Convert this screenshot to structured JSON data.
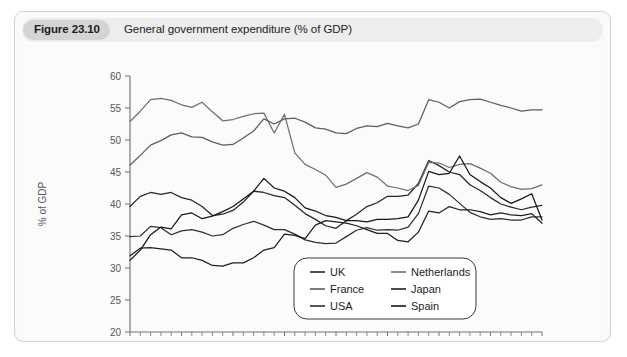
{
  "figure": {
    "number": "Figure 23.10",
    "caption": "General government expenditure (% of GDP)"
  },
  "chart_data": {
    "type": "line",
    "title": "General government expenditure (% of GDP)",
    "xlabel": "",
    "ylabel": "% of GDP",
    "xlim": [
      1980,
      2020
    ],
    "ylim": [
      20,
      60
    ],
    "yticks": [
      20,
      25,
      30,
      35,
      40,
      45,
      50,
      55,
      60
    ],
    "xticks": [
      1980,
      1985,
      1990,
      1995,
      2000,
      2005,
      2010,
      2015,
      2020
    ],
    "xtick_labels": [
      "1980",
      "1985",
      "1990",
      "1995",
      "2000",
      "2005",
      "2010",
      "2015",
      "2020"
    ],
    "ytick_labels": [
      "20",
      "25",
      "30",
      "35",
      "40",
      "45",
      "50",
      "55",
      "60"
    ],
    "minor_xticks": true,
    "grid": false,
    "legend_position": "bottom-right",
    "x": [
      1980,
      1981,
      1982,
      1983,
      1984,
      1985,
      1986,
      1987,
      1988,
      1989,
      1990,
      1991,
      1992,
      1993,
      1994,
      1995,
      1996,
      1997,
      1998,
      1999,
      2000,
      2001,
      2002,
      2003,
      2004,
      2005,
      2006,
      2007,
      2008,
      2009,
      2010,
      2011,
      2012,
      2013,
      2014,
      2015,
      2016,
      2017,
      2018,
      2019,
      2020
    ],
    "series": [
      {
        "name": "UK",
        "color": "#262626",
        "values": [
          39.6,
          41.2,
          41.8,
          41.5,
          41.8,
          41.0,
          40.6,
          39.6,
          38.2,
          38.4,
          39.0,
          40.3,
          42.0,
          41.8,
          41.3,
          41.0,
          39.8,
          38.5,
          37.6,
          36.6,
          36.2,
          37.4,
          38.4,
          39.6,
          40.2,
          41.2,
          41.2,
          41.4,
          43.2,
          46.8,
          46.0,
          45.0,
          44.6,
          43.0,
          42.1,
          41.0,
          40.0,
          39.5,
          39.1,
          39.5,
          39.8
        ]
      },
      {
        "name": "France",
        "color": "#5d5d5d",
        "values": [
          46.1,
          47.6,
          49.2,
          49.9,
          50.8,
          51.1,
          50.5,
          50.4,
          49.7,
          49.2,
          49.3,
          50.3,
          51.4,
          53.3,
          52.5,
          53.3,
          53.4,
          52.8,
          51.9,
          51.7,
          51.1,
          51.0,
          51.8,
          52.2,
          52.1,
          52.6,
          52.2,
          51.9,
          52.5,
          56.3,
          55.9,
          55.0,
          56.0,
          56.3,
          56.4,
          55.9,
          55.4,
          55.0,
          54.5,
          54.7,
          54.7
        ]
      },
      {
        "name": "USA",
        "color": "#2e2e2e",
        "values": [
          34.9,
          35.0,
          36.5,
          36.3,
          35.2,
          35.8,
          36.0,
          35.6,
          35.0,
          35.2,
          36.2,
          36.8,
          37.3,
          36.7,
          36.0,
          36.0,
          35.3,
          34.4,
          34.0,
          33.8,
          33.9,
          34.9,
          35.9,
          36.3,
          35.9,
          36.0,
          35.9,
          36.4,
          38.5,
          42.8,
          42.5,
          41.5,
          40.1,
          38.7,
          38.0,
          37.6,
          37.7,
          37.5,
          37.5,
          38.0,
          38.0
        ]
      },
      {
        "name": "Netherlands",
        "color": "#6e6e6e",
        "values": [
          52.9,
          54.5,
          56.3,
          56.5,
          56.2,
          55.5,
          55.1,
          55.9,
          54.4,
          53.0,
          53.2,
          53.7,
          54.1,
          54.2,
          51.1,
          54.0,
          48.0,
          46.2,
          45.4,
          44.5,
          42.6,
          43.1,
          44.0,
          44.9,
          44.2,
          42.8,
          42.5,
          42.1,
          42.9,
          46.5,
          46.4,
          45.7,
          46.2,
          46.3,
          45.6,
          44.8,
          43.4,
          42.7,
          42.3,
          42.4,
          43.0
        ]
      },
      {
        "name": "Japan",
        "color": "#1f1f1f",
        "values": [
          31.9,
          33.1,
          33.2,
          33.0,
          32.8,
          31.6,
          31.6,
          31.2,
          30.4,
          30.3,
          30.8,
          30.8,
          31.6,
          32.8,
          33.2,
          35.3,
          35.1,
          34.6,
          36.7,
          37.4,
          37.2,
          37.0,
          36.6,
          36.0,
          35.4,
          35.4,
          34.3,
          34.1,
          35.6,
          38.9,
          38.6,
          39.6,
          39.1,
          39.1,
          38.8,
          38.3,
          38.6,
          38.3,
          38.2,
          38.5,
          37.0
        ]
      },
      {
        "name": "Spain",
        "color": "#171717",
        "values": [
          31.2,
          32.8,
          35.2,
          36.4,
          36.1,
          38.3,
          38.6,
          37.7,
          38.1,
          38.8,
          39.6,
          40.8,
          42.0,
          44.0,
          42.5,
          42.0,
          41.0,
          39.4,
          38.9,
          38.2,
          37.9,
          37.4,
          37.4,
          37.2,
          37.6,
          37.6,
          37.7,
          38.0,
          40.6,
          45.1,
          44.6,
          44.8,
          47.5,
          44.6,
          43.5,
          42.5,
          41.0,
          40.1,
          40.8,
          41.6,
          37.5
        ]
      }
    ],
    "legend": [
      {
        "name": "UK",
        "color": "#262626"
      },
      {
        "name": "Netherlands",
        "color": "#6e6e6e"
      },
      {
        "name": "France",
        "color": "#5d5d5d"
      },
      {
        "name": "Japan",
        "color": "#1f1f1f"
      },
      {
        "name": "USA",
        "color": "#2e2e2e"
      },
      {
        "name": "Spain",
        "color": "#171717"
      }
    ]
  }
}
